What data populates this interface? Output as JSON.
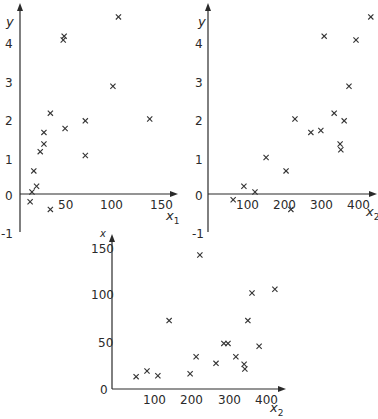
{
  "chart_data": [
    {
      "type": "scatter",
      "panel": "top-left",
      "title": "",
      "xlabel": "x1",
      "ylabel": "y",
      "marker": "x",
      "grid": false,
      "xlim": [
        0,
        165
      ],
      "ylim": [
        -1,
        4.8
      ],
      "xticks": [
        50,
        100,
        150
      ],
      "yticks": [
        -1,
        0,
        1,
        2,
        3,
        4
      ],
      "points": [
        {
          "x": 107,
          "y": 4.6
        },
        {
          "x": 48,
          "y": 4.1
        },
        {
          "x": 47,
          "y": 4.0
        },
        {
          "x": 101,
          "y": 2.8
        },
        {
          "x": 33,
          "y": 2.1
        },
        {
          "x": 71,
          "y": 1.9
        },
        {
          "x": 141,
          "y": 1.95
        },
        {
          "x": 26,
          "y": 1.6
        },
        {
          "x": 49,
          "y": 1.7
        },
        {
          "x": 26,
          "y": 1.3
        },
        {
          "x": 22,
          "y": 1.1
        },
        {
          "x": 71,
          "y": 1.0
        },
        {
          "x": 15,
          "y": 0.6
        },
        {
          "x": 18,
          "y": 0.2
        },
        {
          "x": 13,
          "y": 0.05
        },
        {
          "x": 11,
          "y": -0.2
        },
        {
          "x": 33,
          "y": -0.4
        }
      ]
    },
    {
      "type": "scatter",
      "panel": "top-right",
      "title": "",
      "xlabel": "x2",
      "ylabel": "y",
      "marker": "x",
      "grid": false,
      "xlim": [
        0,
        450
      ],
      "ylim": [
        -1,
        4.8
      ],
      "xticks": [
        100,
        200,
        300,
        400
      ],
      "yticks": [
        -1,
        0,
        1,
        2,
        3,
        4
      ],
      "points": [
        {
          "x": 440,
          "y": 4.6
        },
        {
          "x": 314,
          "y": 4.1
        },
        {
          "x": 400,
          "y": 4.0
        },
        {
          "x": 381,
          "y": 2.8
        },
        {
          "x": 341,
          "y": 2.1
        },
        {
          "x": 235,
          "y": 1.95
        },
        {
          "x": 368,
          "y": 1.9
        },
        {
          "x": 278,
          "y": 1.6
        },
        {
          "x": 305,
          "y": 1.65
        },
        {
          "x": 357,
          "y": 1.3
        },
        {
          "x": 359,
          "y": 1.15
        },
        {
          "x": 157,
          "y": 0.95
        },
        {
          "x": 211,
          "y": 0.6
        },
        {
          "x": 97,
          "y": 0.2
        },
        {
          "x": 127,
          "y": 0.05
        },
        {
          "x": 68,
          "y": -0.15
        },
        {
          "x": 224,
          "y": -0.4
        }
      ]
    },
    {
      "type": "scatter",
      "panel": "bottom",
      "title": "",
      "xlabel": "x2",
      "ylabel": "x",
      "marker": "x",
      "grid": false,
      "xlim": [
        0,
        450
      ],
      "ylim": [
        0,
        155
      ],
      "xticks": [
        100,
        200,
        300,
        400
      ],
      "yticks": [
        0,
        50,
        100,
        150
      ],
      "points": [
        {
          "x": 59,
          "y": 13
        },
        {
          "x": 88,
          "y": 19
        },
        {
          "x": 117,
          "y": 14
        },
        {
          "x": 147,
          "y": 72
        },
        {
          "x": 203,
          "y": 16
        },
        {
          "x": 219,
          "y": 34
        },
        {
          "x": 229,
          "y": 141
        },
        {
          "x": 272,
          "y": 27
        },
        {
          "x": 293,
          "y": 48
        },
        {
          "x": 304,
          "y": 48
        },
        {
          "x": 325,
          "y": 34
        },
        {
          "x": 347,
          "y": 26
        },
        {
          "x": 349,
          "y": 21
        },
        {
          "x": 357,
          "y": 72
        },
        {
          "x": 368,
          "y": 101
        },
        {
          "x": 387,
          "y": 45
        },
        {
          "x": 429,
          "y": 105
        }
      ]
    }
  ],
  "panels": {
    "top_left": {
      "ylabel": "y",
      "xlabel_main": "x",
      "xlabel_sub": "1",
      "yticks": [
        "-1",
        "0",
        "1",
        "2",
        "3",
        "4"
      ],
      "xticks": [
        "50",
        "100",
        "150"
      ]
    },
    "top_right": {
      "ylabel": "y",
      "xlabel_main": "x",
      "xlabel_sub": "2",
      "yticks": [
        "-1",
        "0",
        "1",
        "2",
        "3",
        "4"
      ],
      "xticks": [
        "100",
        "200",
        "300",
        "400"
      ]
    },
    "bottom": {
      "ylabel": "x",
      "xlabel_main": "x",
      "xlabel_sub": "2",
      "yticks": [
        "0",
        "50",
        "100",
        "150"
      ],
      "xticks": [
        "100",
        "200",
        "300",
        "400"
      ]
    }
  },
  "colors": {
    "ink": "#2a2a2a",
    "background": "#ffffff"
  }
}
